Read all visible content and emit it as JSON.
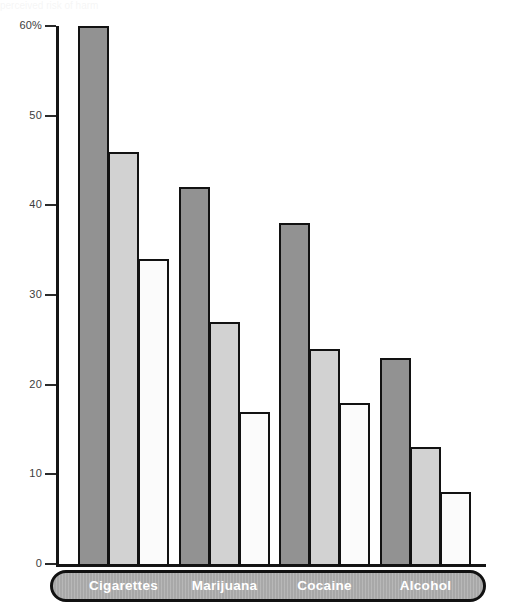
{
  "chart": {
    "type": "bar",
    "title": "",
    "xlabel": "",
    "ylabel": "",
    "clipped_top_text": "perceived risk of harm"
  },
  "chart_data": {
    "type": "bar",
    "title": "",
    "subtitle": "",
    "xlabel": "",
    "ylabel": "",
    "ylim": [
      0,
      60
    ],
    "grid": false,
    "legend": null,
    "axis": {
      "y_tick_values": [
        0,
        10,
        20,
        30,
        40,
        50,
        60
      ],
      "y_tick_labels": [
        "0",
        "10",
        "20",
        "30",
        "40",
        "50",
        "60%"
      ]
    },
    "categories": [
      "Cigarettes",
      "Marijuana",
      "Cocaine",
      "Alcohol"
    ],
    "series": [
      {
        "name": "series-1",
        "color": "#929292",
        "values": [
          60,
          42,
          38,
          23
        ]
      },
      {
        "name": "series-2",
        "color": "#d2d2d2",
        "values": [
          46,
          27,
          24,
          13
        ]
      },
      {
        "name": "series-3",
        "color": "#fbfbfb",
        "values": [
          34,
          17,
          18,
          8
        ]
      }
    ]
  },
  "layout": {
    "axis_x": 56,
    "baseline_y": 564,
    "top_y": 26,
    "px_per_unit": 8.966,
    "bar_width": 31,
    "group_starts": [
      78,
      179,
      279,
      380
    ]
  }
}
